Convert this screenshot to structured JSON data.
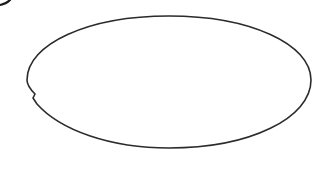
{
  "canvas": {
    "width": 313,
    "height": 171,
    "background": "#ffffff"
  },
  "shapes": [
    {
      "type": "ellipse",
      "name": "main-ellipse",
      "cx": 169,
      "cy": 82,
      "rx": 142,
      "ry": 66,
      "stroke": "#2b2b2b",
      "stroke_width": 1.6,
      "fill": "#ffffff",
      "note": "small notch on left side near y=95"
    },
    {
      "type": "arc-fragment",
      "name": "corner-fragment",
      "position": "top-left",
      "stroke": "#1a1a1a"
    }
  ]
}
